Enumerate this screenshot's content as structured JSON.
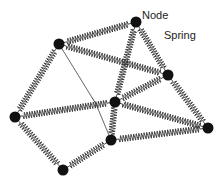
{
  "labels": {
    "node": "Node",
    "spring": "Spring"
  },
  "colors": {
    "node": "#111111",
    "spring": "#333333",
    "background": "#ffffff"
  },
  "nodes": [
    {
      "id": "A",
      "x": 59,
      "y": 44
    },
    {
      "id": "B",
      "x": 136,
      "y": 22
    },
    {
      "id": "C",
      "x": 168,
      "y": 75
    },
    {
      "id": "D",
      "x": 115,
      "y": 102
    },
    {
      "id": "E",
      "x": 15,
      "y": 117
    },
    {
      "id": "F",
      "x": 208,
      "y": 128
    },
    {
      "id": "G",
      "x": 111,
      "y": 140
    },
    {
      "id": "H",
      "x": 63,
      "y": 170
    },
    {
      "id": "J",
      "x": 96,
      "y": 104
    }
  ],
  "springs": [
    [
      "A",
      "B"
    ],
    [
      "A",
      "C"
    ],
    [
      "A",
      "E"
    ],
    [
      "A",
      "J"
    ],
    [
      "J",
      "G"
    ],
    [
      "B",
      "C"
    ],
    [
      "B",
      "D"
    ],
    [
      "C",
      "D"
    ],
    [
      "C",
      "F"
    ],
    [
      "E",
      "D"
    ],
    [
      "D",
      "F"
    ],
    [
      "D",
      "G"
    ],
    [
      "E",
      "H"
    ],
    [
      "H",
      "G"
    ],
    [
      "G",
      "F"
    ]
  ]
}
